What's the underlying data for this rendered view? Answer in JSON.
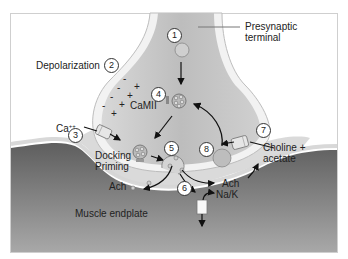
{
  "diagram": {
    "type": "neuromuscular-junction",
    "labels": {
      "presynaptic": "Presynaptic terminal",
      "presynaptic_line1": "Presynaptic",
      "presynaptic_line2": "terminal",
      "depolarization": "Depolarization",
      "calcium": "Ca++",
      "calcium_base": "Ca",
      "calcium_sup": "++",
      "camii": "CaMII",
      "docking": "Docking",
      "priming": "Priming",
      "ach_left": "Ach",
      "ach_right": "Ach",
      "na_k": "Na/K",
      "choline_line1": "Choline +",
      "choline_line2": "acetate",
      "muscle": "Muscle endplate"
    },
    "steps": [
      "1",
      "2",
      "3",
      "4",
      "5",
      "6",
      "7",
      "8"
    ],
    "charges": {
      "minus": "-",
      "plus": "+"
    },
    "colors": {
      "terminal_fill": "#c8c8c8",
      "terminal_edge": "#e8e8e8",
      "cleft_fill": "#d4d4d4",
      "muscle_top": "#6a6a6a",
      "muscle_bottom": "#a0a0a0",
      "frame": "#cfcfcf"
    }
  }
}
